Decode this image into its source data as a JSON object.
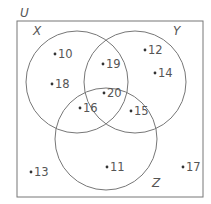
{
  "diagram": {
    "type": "venn",
    "universe": {
      "label": "U",
      "label_pos": [
        20,
        17
      ],
      "rect": {
        "x": 17,
        "y": 21,
        "w": 186,
        "h": 176
      }
    },
    "sets": [
      {
        "label": "X",
        "cx": 77,
        "cy": 82,
        "r": 51,
        "label_pos": [
          33,
          35
        ]
      },
      {
        "label": "Y",
        "cx": 135,
        "cy": 82,
        "r": 51,
        "label_pos": [
          173,
          35
        ]
      },
      {
        "label": "Z",
        "cx": 106,
        "cy": 139,
        "r": 51,
        "label_pos": [
          152,
          187
        ]
      }
    ],
    "elements": [
      {
        "value": "10",
        "region": "X only",
        "x": 55,
        "y": 58
      },
      {
        "value": "18",
        "region": "X only",
        "x": 52,
        "y": 88
      },
      {
        "value": "19",
        "region": "X ∩ Y only",
        "x": 103,
        "y": 68
      },
      {
        "value": "12",
        "region": "Y only",
        "x": 145,
        "y": 54
      },
      {
        "value": "14",
        "region": "Y only",
        "x": 155,
        "y": 77
      },
      {
        "value": "20",
        "region": "X ∩ Y ∩ Z",
        "x": 104,
        "y": 97
      },
      {
        "value": "16",
        "region": "X ∩ Z only",
        "x": 80,
        "y": 112
      },
      {
        "value": "15",
        "region": "Y ∩ Z only",
        "x": 131,
        "y": 115
      },
      {
        "value": "11",
        "region": "Z only",
        "x": 107,
        "y": 171
      },
      {
        "value": "13",
        "region": "outside",
        "x": 31,
        "y": 176
      },
      {
        "value": "17",
        "region": "outside",
        "x": 183,
        "y": 171
      }
    ],
    "colors": {
      "stroke": "#777777",
      "text": "#555555",
      "background": "#ffffff"
    }
  }
}
